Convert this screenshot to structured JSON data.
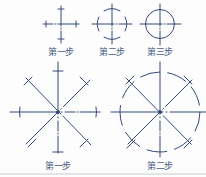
{
  "diagram": {
    "title": "",
    "stroke_color": "#34497a",
    "label_color": "#4a5f86",
    "small_circle_steps": [
      {
        "label": "第一步",
        "description": "draw centerlines and mark radius points",
        "center": [
          61,
          24
        ]
      },
      {
        "label": "第二步",
        "description": "draw short arcs at radius marks",
        "center": [
          112,
          24
        ]
      },
      {
        "label": "第三步",
        "description": "complete the circle",
        "center": [
          160,
          24
        ]
      }
    ],
    "large_circle_steps": [
      {
        "label": "第一步",
        "description": "draw centerlines and two diagonals, mark radius on all eight rays",
        "center": [
          58,
          112
        ]
      },
      {
        "label": "第二步",
        "description": "draw arcs through radius marks",
        "center": [
          160,
          112
        ]
      }
    ]
  }
}
